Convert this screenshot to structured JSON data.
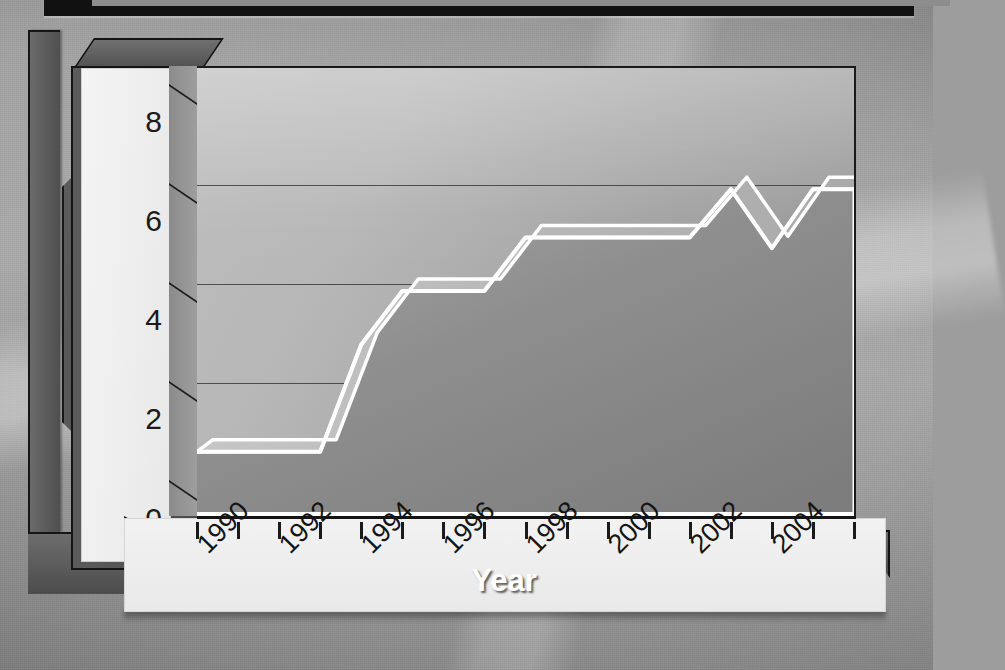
{
  "chart_data": {
    "type": "area",
    "title": "",
    "subtitle": "",
    "xlabel": "Year",
    "ylabel": "Populations",
    "grid": true,
    "legend": "none",
    "style": "3D grayscale ribbon area chart",
    "xlim": [
      1990,
      2006
    ],
    "ylim": [
      0,
      8.4
    ],
    "y_ticks": [
      "0",
      "2",
      "4",
      "6",
      "8"
    ],
    "y_tick_values": [
      0,
      2,
      4,
      6,
      8
    ],
    "x_tick_values": [
      1990,
      1991,
      1992,
      1993,
      1994,
      1995,
      1996,
      1997,
      1998,
      1999,
      2000,
      2001,
      2002,
      2003,
      2004,
      2005,
      2006
    ],
    "x_tick_labels": [
      "1990",
      "",
      "1992",
      "",
      "1994",
      "",
      "1996",
      "",
      "1998",
      "",
      "2000",
      "",
      "2002",
      "",
      "2004",
      "",
      ""
    ],
    "x_labels_shown": [
      "1990",
      "1992",
      "1994",
      "1996",
      "1998",
      "2000",
      "2002",
      "2004"
    ],
    "x_label_rotation_deg": -45,
    "series": [
      {
        "name": "Populations",
        "x": [
          1990,
          1991,
          1992,
          1993,
          1994,
          1995,
          1996,
          1997,
          1998,
          1999,
          2000,
          2001,
          2002,
          2003,
          2004,
          2005,
          2006
        ],
        "values": [
          1.2,
          1.2,
          1.2,
          1.2,
          3.2,
          4.2,
          4.2,
          4.2,
          5.2,
          5.2,
          5.2,
          5.2,
          5.2,
          6.1,
          5.0,
          6.1,
          6.1
        ]
      }
    ]
  },
  "axes": {
    "y_title": "Populations",
    "x_title": "Year",
    "y_tick_labels": [
      "8",
      "6",
      "4",
      "2",
      "0"
    ],
    "x_tick_labels": [
      "1990",
      "1992",
      "1994",
      "1996",
      "1998",
      "2000",
      "2002",
      "2004"
    ]
  },
  "colors": {
    "page_background": "#9d9d9d",
    "frame_dark": "#4c4c4c",
    "frame_outline": "#141414",
    "axis_band": "#f0f0f0",
    "plot_gradient_light": "#bdbdbd",
    "plot_gradient_dark": "#9a9a9a",
    "series_outline": "#ffffff",
    "series_fill": "#8f8f8f",
    "series_top_face": "#b9b9b9",
    "series_end_face": "#3a3a3a",
    "text_dark": "#141414",
    "text_light": "#ffffff"
  }
}
